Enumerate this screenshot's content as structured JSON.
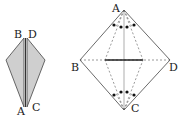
{
  "figure_left": {
    "description": "folded kite (side view)",
    "fill_color": "#cfcfcf",
    "labels": {
      "B": "B",
      "D": "D",
      "A": "A",
      "C": "C"
    }
  },
  "figure_right": {
    "description": "square ABCD (rotated) with fold lines and angle marks",
    "labels": {
      "A": "A",
      "B": "B",
      "C": "C",
      "D": "D"
    }
  }
}
